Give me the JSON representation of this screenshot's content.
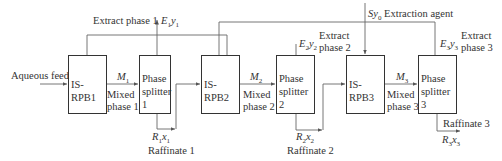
{
  "diagram": {
    "type": "process-flow",
    "units": [
      {
        "id": "rpb1",
        "label": "IS-RPB1"
      },
      {
        "id": "ps1",
        "label_line1": "Phase",
        "label_line2": "splitter 1"
      },
      {
        "id": "rpb2",
        "label": "IS-RPB2"
      },
      {
        "id": "ps2",
        "label_line1": "Phase",
        "label_line2": "splitter 2"
      },
      {
        "id": "rpb3",
        "label": "IS-RPB3"
      },
      {
        "id": "ps3",
        "label_line1": "Phase",
        "label_line2": "splitter 3"
      }
    ],
    "streams": {
      "feed": "Aqueous feed",
      "m1_symbol": "M",
      "m1_sub": "1",
      "m1_name_line1": "Mixed",
      "m1_name_line2": "phase 1",
      "m2_symbol": "M",
      "m2_sub": "2",
      "m2_name_line1": "Mixed",
      "m2_name_line2": "phase 2",
      "m3_symbol": "M",
      "m3_sub": "3",
      "m3_name_line1": "Mixed",
      "m3_name_line2": "phase 3",
      "extract1_name": "Extract phase 1",
      "extract1_symbol": "E",
      "extract1_sub": "1",
      "extract1_var": "y",
      "extract1_var_sub": "1",
      "extract2_name_line1": "Extract",
      "extract2_name_line2": "phase 2",
      "extract2_symbol": "E",
      "extract2_sub": "2",
      "extract2_var": "y",
      "extract2_var_sub": "2",
      "extract3_name_line1": "Extract",
      "extract3_name_line2": "phase 3",
      "extract3_symbol": "E",
      "extract3_sub": "3",
      "extract3_var": "y",
      "extract3_var_sub": "3",
      "raffinate1_name": "Raffinate 1",
      "raffinate1_symbol": "R",
      "raffinate1_sub": "1",
      "raffinate1_var": "x",
      "raffinate1_var_sub": "1",
      "raffinate2_name": "Raffinate 2",
      "raffinate2_symbol": "R",
      "raffinate2_sub": "2",
      "raffinate2_var": "x",
      "raffinate2_var_sub": "2",
      "raffinate3_name": "Raffinate 3",
      "raffinate3_symbol": "R",
      "raffinate3_sub": "3",
      "raffinate3_var": "x",
      "raffinate3_var_sub": "3",
      "agent_symbol": "S",
      "agent_var": "y",
      "agent_var_sub": "0",
      "agent_name": "Extraction agent"
    },
    "colors": {
      "line": "#555555",
      "box_border": "#333333",
      "text": "#333333"
    }
  }
}
